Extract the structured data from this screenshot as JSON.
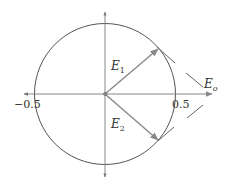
{
  "diagram": {
    "type": "phasor-diagram",
    "colors": {
      "circle": "#555555",
      "axis": "#888888",
      "phasor": "#888888",
      "text": "#333333"
    },
    "axis_labels": {
      "neg_x": "−0.5",
      "pos_x": "0.5"
    },
    "phasors": [
      {
        "name": "E1",
        "base": "E",
        "sub": "1"
      },
      {
        "name": "E2",
        "base": "E",
        "sub": "2"
      },
      {
        "name": "Eo",
        "base": "E",
        "sub": "o"
      }
    ]
  }
}
